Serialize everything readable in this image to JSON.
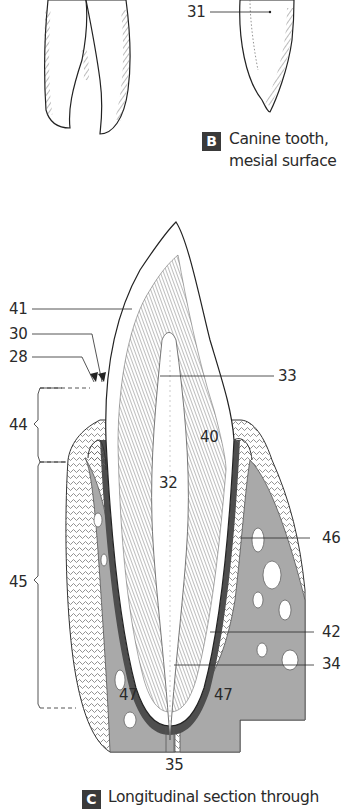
{
  "figure_b": {
    "badge": "B",
    "caption_line1": "Canine tooth,",
    "caption_line2": "mesial surface",
    "labels": {
      "l31": "31"
    }
  },
  "figure_c": {
    "badge": "C",
    "caption": "Longitudinal section through",
    "labels": {
      "l41": "41",
      "l30": "30",
      "l28": "28",
      "l33": "33",
      "l44": "44",
      "l40": "40",
      "l32": "32",
      "l46": "46",
      "l45": "45",
      "l42": "42",
      "l34": "34",
      "l47a": "47",
      "l47b": "47",
      "l35": "35"
    }
  },
  "colors": {
    "bone": "#a9a9a9",
    "periodontal": "#4e4e4e",
    "line": "#2a2a2a",
    "background": "#ffffff"
  }
}
